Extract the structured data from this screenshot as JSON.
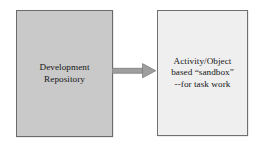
{
  "diagram": {
    "type": "flow-diagram",
    "background_color": "#ffffff",
    "nodes": [
      {
        "id": "development-repository",
        "label": "Development\nRepository",
        "lines": [
          "Development",
          "Repository"
        ],
        "shape": "rectangle",
        "fill_color": "#c9c9c9",
        "border_color": "#6b6b6b",
        "text_color": "#161616"
      },
      {
        "id": "sandbox",
        "label": "Activity/Object\nbased “sandbox”\n--for task work",
        "lines": [
          "Activity/Object",
          "based “sandbox”",
          "--for task work"
        ],
        "shape": "rectangle",
        "fill_color": "#efefef",
        "border_color": "#707070",
        "text_color": "#161616"
      }
    ],
    "connectors": [
      {
        "id": "repo-to-sandbox",
        "kind": "arrow",
        "direction": "right",
        "from": "development-repository",
        "to": "sandbox",
        "color": "#9b9b9b",
        "outline_color": "#6f6f6f",
        "label": ""
      }
    ]
  }
}
